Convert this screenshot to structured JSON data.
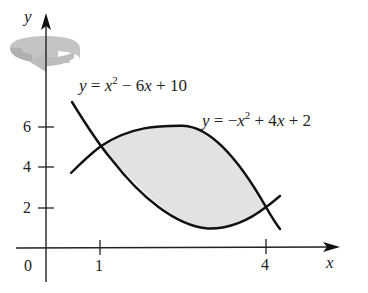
{
  "figure": {
    "axes": {
      "x_label": "x",
      "y_label": "y",
      "origin_label": "0",
      "x_ticks": [
        {
          "value": 1,
          "label": "1"
        },
        {
          "value": 4,
          "label": "4"
        }
      ],
      "y_ticks": [
        {
          "value": 2,
          "label": "2"
        },
        {
          "value": 4,
          "label": "4"
        },
        {
          "value": 6,
          "label": "6"
        }
      ]
    },
    "curves": [
      {
        "name": "upper-left-curve",
        "equation_parts": {
          "lhs": "y",
          "eq": " = ",
          "x": "x",
          "exp": "2",
          "rest1": " − 6",
          "x2": "x",
          "rest2": " + 10"
        },
        "equation_text": "y = x^2 − 6x + 10"
      },
      {
        "name": "arch-curve",
        "equation_parts": {
          "lhs": "y",
          "eq": " = −",
          "x": "x",
          "exp": "2",
          "rest1": " + 4",
          "x2": "x",
          "rest2": " + 2"
        },
        "equation_text": "y = −x^2 + 4x + 2"
      }
    ],
    "intersections": [
      {
        "x": 1,
        "y": 5
      },
      {
        "x": 4,
        "y": 2
      }
    ],
    "shaded_region": {
      "from_x": 1,
      "to_x": 4,
      "color": "#e2e2e2"
    },
    "rotation_arrow": {
      "axis": "y-axis",
      "color": "#b5b5b5"
    },
    "colors": {
      "curve": "#111111",
      "axis": "#222222",
      "fill": "#e2e2e2",
      "rotation_arrow": "#b5b5b5"
    }
  }
}
